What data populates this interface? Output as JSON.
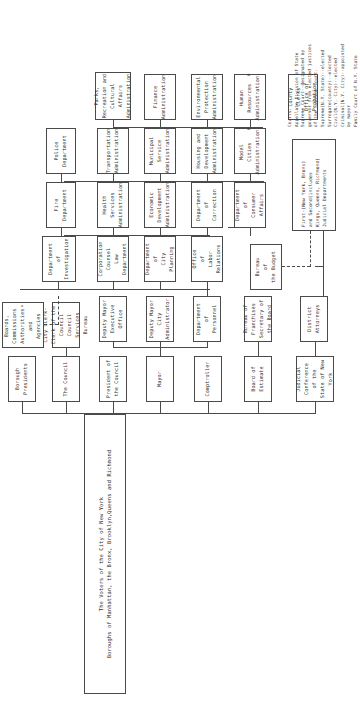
{
  "document": {
    "kind": "organization-chart",
    "title_line_1": "The Voters of the City of New York",
    "title_line_2": "Boroughs of Manhattan, the Bronx, Brooklyn,Queens and Richmond"
  },
  "nodes": {
    "voters": "The Voters of the City of New York\nBoroughs of Manhattan, the Bronx, Brooklyn,Queens and Richmond",
    "judicial_conference": "Judicial Conference\nof the\nState of New York",
    "board_of_estimate": "Board of Estimate",
    "comptroller": "Comptroller",
    "mayor": "Mayor",
    "president_of_council": "President of\nthe Council",
    "the_council": "The Council",
    "borough_presidents": "Borough Presidents",
    "district_attorneys": "District\nAttorneys",
    "bureau_franchises": "Bureau of Franchises\nSecretary of the Board",
    "bureau_budget": "Bureau\nof\nthe Budget",
    "dept_personnel": "Department\nof\nPersonnel",
    "deputy_mayor_city_admin": "Deputy Mayor\nCity\nAdministrator",
    "deputy_mayor_exec": "Deputy Mayor\nExecutive\nOffice",
    "city_clerk": "City Clerk-Clerk of the Council\nCouncil Services Bureau",
    "boards_commissions": "Boards, Commissions\nAuthorities\nand Agencies",
    "boards_commissions_note": "a",
    "dept_consumer_affairs": "Department\nof\nConsumer Affairs",
    "office_labor_relations": "Office\nof\nLabor Relations",
    "dept_city_planning": "Department\nof\nCity Planning",
    "corporation_counsel": "Corporation\nCounsel\nLaw Department",
    "dept_investigation": "Department\nof\nInvestigation",
    "model_cities": "Model\nCities\nAdministration",
    "model_cities_note": "b",
    "dept_correction": "Department\nof\nCorrection",
    "economic_development": "Economic\nDevelopment\nAdministration",
    "health_services": "Health\nServices\nAdministration",
    "fire_department": "Fire\nDepartment",
    "housing_development": "Housing and\nDevelopment\nAdministration",
    "municipal_service": "Municipal\nService\nAdministration",
    "transportation": "Transportation\nAdministration",
    "police_department": "Police\nDepartment",
    "human_resources": "Human\nResources\nAdministration",
    "human_resources_note": "b",
    "environmental_protection": "Environmental\nProtection\nAdministration",
    "finance": "Finance\nAdministration",
    "parks_recreation": "Parks, Recreation and\nCultural Affairs\nAdministration",
    "county_clerks": "County Clerks\nOffice of Probation",
    "first_second_dept": "First-(New York, Bronx)\nand Second(includes\nKings, Queens, Richmond)\nJudicial Departments",
    "courts_note": "Courts:\nAppellate Division of State\nSupreme Court--designated by\ngovernor from elected justices\nof the Supreme Court.\nSupreme(N.Y. State)--elected\nSurrogate(county)--elected\nCivil(N.Y. City)--elected\nCriminal(N.Y. City)--appointed\nby mayor\nFamily Court of N.Y. State\nwithin N.Y. City--appointed\nby mayor"
  },
  "colors": {
    "stroke": "#4a4a4a",
    "text": "#2f2f2f",
    "background": "#ffffff"
  }
}
